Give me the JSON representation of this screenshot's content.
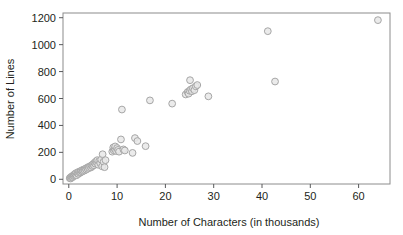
{
  "chart_data": {
    "type": "scatter",
    "title": "",
    "xlabel": "Number of Characters (in thousands)",
    "ylabel": "Number of Lines",
    "xlim": [
      -1.2,
      66.5
    ],
    "ylim": [
      -35,
      1235
    ],
    "xticks": [
      0,
      10,
      20,
      30,
      40,
      50,
      60
    ],
    "yticks": [
      0,
      200,
      400,
      600,
      800,
      1000,
      1200
    ],
    "xticklabels": [
      "0",
      "10",
      "20",
      "30",
      "40",
      "50",
      "60"
    ],
    "yticklabels": [
      "0",
      "200",
      "400",
      "600",
      "800",
      "1000",
      "1200"
    ],
    "grid": false,
    "legend": null,
    "marker": {
      "shape": "circle",
      "face_color": "#e8e8e8",
      "edge_color": "#a6a6a6",
      "size_px": 4.4
    },
    "frame_color": "#8c8c8c",
    "background": "#ffffff",
    "points": [
      [
        0.2,
        8
      ],
      [
        0.3,
        12
      ],
      [
        0.4,
        6
      ],
      [
        0.5,
        18
      ],
      [
        0.6,
        14
      ],
      [
        0.7,
        22
      ],
      [
        0.8,
        16
      ],
      [
        0.9,
        28
      ],
      [
        1.0,
        24
      ],
      [
        1.1,
        34
      ],
      [
        1.2,
        30
      ],
      [
        1.3,
        40
      ],
      [
        1.4,
        36
      ],
      [
        1.5,
        46
      ],
      [
        1.6,
        30
      ],
      [
        1.8,
        44
      ],
      [
        1.9,
        52
      ],
      [
        2.0,
        40
      ],
      [
        2.1,
        56
      ],
      [
        2.3,
        48
      ],
      [
        2.4,
        60
      ],
      [
        2.5,
        52
      ],
      [
        2.6,
        64
      ],
      [
        2.8,
        58
      ],
      [
        2.9,
        70
      ],
      [
        3.0,
        62
      ],
      [
        3.2,
        74
      ],
      [
        3.3,
        66
      ],
      [
        3.5,
        80
      ],
      [
        3.6,
        72
      ],
      [
        3.8,
        86
      ],
      [
        3.9,
        78
      ],
      [
        4.1,
        92
      ],
      [
        4.2,
        84
      ],
      [
        4.4,
        96
      ],
      [
        4.6,
        88
      ],
      [
        4.7,
        104
      ],
      [
        4.9,
        98
      ],
      [
        5.0,
        112
      ],
      [
        5.2,
        104
      ],
      [
        5.3,
        122
      ],
      [
        5.5,
        116
      ],
      [
        5.6,
        132
      ],
      [
        5.8,
        126
      ],
      [
        5.9,
        142
      ],
      [
        6.1,
        108
      ],
      [
        6.3,
        136
      ],
      [
        6.5,
        120
      ],
      [
        6.7,
        146
      ],
      [
        6.9,
        96
      ],
      [
        7.0,
        186
      ],
      [
        7.2,
        130
      ],
      [
        7.4,
        90
      ],
      [
        7.6,
        142
      ],
      [
        9.0,
        205
      ],
      [
        9.2,
        236
      ],
      [
        9.3,
        215
      ],
      [
        9.5,
        226
      ],
      [
        9.6,
        244
      ],
      [
        9.8,
        210
      ],
      [
        10.0,
        232
      ],
      [
        10.2,
        218
      ],
      [
        10.4,
        205
      ],
      [
        10.8,
        296
      ],
      [
        11.0,
        518
      ],
      [
        11.3,
        222
      ],
      [
        11.6,
        214
      ],
      [
        13.2,
        196
      ],
      [
        13.7,
        306
      ],
      [
        14.2,
        284
      ],
      [
        15.9,
        246
      ],
      [
        16.8,
        586
      ],
      [
        21.4,
        562
      ],
      [
        24.2,
        630
      ],
      [
        24.6,
        648
      ],
      [
        24.8,
        636
      ],
      [
        25.0,
        658
      ],
      [
        25.1,
        736
      ],
      [
        25.3,
        668
      ],
      [
        25.5,
        654
      ],
      [
        25.7,
        676
      ],
      [
        26.0,
        662
      ],
      [
        26.3,
        690
      ],
      [
        26.6,
        700
      ],
      [
        28.9,
        616
      ],
      [
        41.2,
        1100
      ],
      [
        42.7,
        726
      ],
      [
        64.0,
        1182
      ]
    ]
  },
  "axis": {
    "y_label": "Number of Lines",
    "x_label": "Number of Characters (in thousands)"
  }
}
